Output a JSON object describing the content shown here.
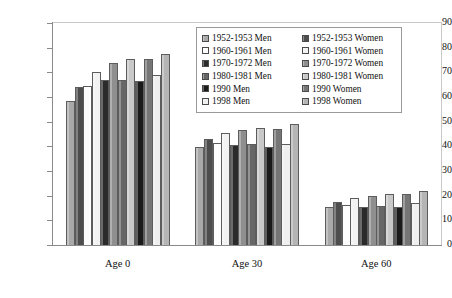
{
  "chart_data": {
    "type": "bar",
    "title": "",
    "xlabel": "",
    "ylabel": "Further life expectancy in years",
    "categories": [
      "Age 0",
      "Age 30",
      "Age 60"
    ],
    "ylim": [
      0,
      90
    ],
    "yticks": [
      0,
      10,
      20,
      30,
      40,
      50,
      60,
      70,
      80,
      90
    ],
    "grid": false,
    "legend_position": "top-right inside plot",
    "series": [
      {
        "name": "1952-1953 Men",
        "color": "#a9a9a9",
        "values": [
          58.5,
          39.8,
          15.4
        ]
      },
      {
        "name": "1952-1953 Women",
        "color": "#4d4d4d",
        "values": [
          64.2,
          43.1,
          17.3
        ]
      },
      {
        "name": "1960-1961 Men",
        "color": "#fdfdfd",
        "values": [
          64.6,
          41.4,
          16.1
        ]
      },
      {
        "name": "1960-1961 Women",
        "color": "#f2f2f2",
        "values": [
          70.3,
          45.5,
          19.2
        ]
      },
      {
        "name": "1970-1972 Men",
        "color": "#2b2b2b",
        "values": [
          66.8,
          40.6,
          15.5
        ]
      },
      {
        "name": "1970-1972 Women",
        "color": "#8f8f8f",
        "values": [
          73.6,
          46.6,
          19.7
        ]
      },
      {
        "name": "1980-1981 Men",
        "color": "#666666",
        "values": [
          66.9,
          40.9,
          15.9
        ]
      },
      {
        "name": "1980-1981 Women",
        "color": "#c8c8c8",
        "values": [
          75.5,
          47.5,
          20.6
        ]
      },
      {
        "name": "1990 Men",
        "color": "#1a1a1a",
        "values": [
          66.5,
          39.8,
          15.5
        ]
      },
      {
        "name": "1990 Women",
        "color": "#767676",
        "values": [
          75.6,
          47.2,
          20.8
        ]
      },
      {
        "name": "1998 Men",
        "color": "#efefef",
        "values": [
          68.8,
          41.1,
          17.1
        ]
      },
      {
        "name": "1998 Women",
        "color": "#b5b5b5",
        "values": [
          77.4,
          49.0,
          21.9
        ]
      }
    ]
  },
  "legend": {
    "columns": [
      [
        "1952-1953 Men",
        "1960-1961 Men",
        "1970-1972 Men",
        "1980-1981 Men",
        "1990 Men",
        "1998 Men"
      ],
      [
        "1952-1953 Women",
        "1960-1961 Women",
        "1970-1972 Women",
        "1980-1981 Women",
        "1990 Women",
        "1998 Women"
      ]
    ]
  }
}
